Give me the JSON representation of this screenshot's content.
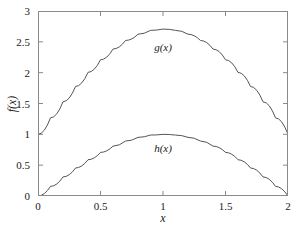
{
  "chart_data": {
    "type": "line",
    "title": "",
    "subtitle": "",
    "xlabel": "x",
    "ylabel": "f(x)",
    "xlim": [
      0,
      2
    ],
    "ylim": [
      0,
      3
    ],
    "grid": false,
    "legend_position": "inline-curve-labels",
    "xticks": [
      "0",
      "0.5",
      "1",
      "1.5",
      "2"
    ],
    "xtick_values": [
      0,
      0.5,
      1,
      1.5,
      2
    ],
    "yticks": [
      "0",
      "0.5",
      "1",
      "1.5",
      "2",
      "2.5",
      "3"
    ],
    "ytick_values": [
      0,
      0.5,
      1,
      1.5,
      2,
      2.5,
      3
    ],
    "line_color": "#555555",
    "frame_color": "#8a8a8a",
    "background_color": "#ffffff",
    "series": [
      {
        "name": "g(x)",
        "label": "g(x)",
        "label_x": 1.0,
        "label_y": 2.42,
        "x": [
          0,
          0.1,
          0.2,
          0.3,
          0.4,
          0.5,
          0.6,
          0.7,
          0.8,
          0.9,
          1.0,
          1.1,
          1.2,
          1.3,
          1.4,
          1.5,
          1.6,
          1.7,
          1.8,
          1.9,
          2.0
        ],
        "values": [
          1.0,
          1.267,
          1.528,
          1.776,
          2.005,
          2.209,
          2.383,
          2.522,
          2.624,
          2.686,
          2.707,
          2.686,
          2.624,
          2.522,
          2.383,
          2.209,
          2.005,
          1.776,
          1.528,
          1.267,
          1.0
        ]
      },
      {
        "name": "h(x)",
        "label": "h(x)",
        "label_x": 1.0,
        "label_y": 0.78,
        "x": [
          0,
          0.1,
          0.2,
          0.3,
          0.4,
          0.5,
          0.6,
          0.7,
          0.8,
          0.9,
          1.0,
          1.1,
          1.2,
          1.3,
          1.4,
          1.5,
          1.6,
          1.7,
          1.8,
          1.9,
          2.0
        ],
        "values": [
          0.0,
          0.156,
          0.309,
          0.454,
          0.588,
          0.707,
          0.809,
          0.891,
          0.951,
          0.988,
          1.0,
          0.988,
          0.951,
          0.891,
          0.809,
          0.707,
          0.588,
          0.454,
          0.309,
          0.156,
          0.0
        ]
      }
    ]
  }
}
